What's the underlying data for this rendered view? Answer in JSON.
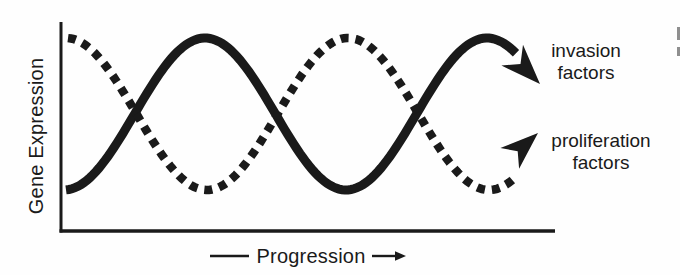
{
  "figure": {
    "background_color": "#fefefe",
    "ink_color": "#1a1a1a",
    "y_axis_label": "Gene Expression",
    "x_axis_label": "Progression",
    "invasion_label_line1": "invasion",
    "invasion_label_line2": "factors",
    "proliferation_label_line1": "proliferation",
    "proliferation_label_line2": "factors"
  },
  "chart_data": {
    "type": "line",
    "title": "",
    "xlabel": "Progression",
    "ylabel": "Gene Expression",
    "x_axis_ticks": [],
    "y_axis_ticks": [],
    "grid": false,
    "legend_position": "right-annotations",
    "x_normalized": [
      0,
      0.1,
      0.2,
      0.3,
      0.4,
      0.5,
      0.6,
      0.7,
      0.8,
      0.9,
      1.0
    ],
    "series": [
      {
        "name": "invasion factors",
        "line_style": "solid",
        "ends_with": "arrowhead pointing down-right",
        "values": [
          0.0,
          0.25,
          0.73,
          1.0,
          0.8,
          0.32,
          0.01,
          0.16,
          0.62,
          0.97,
          0.88
        ]
      },
      {
        "name": "proliferation factors",
        "line_style": "dotted",
        "ends_with": "arrowhead pointing up-right",
        "values": [
          1.0,
          0.75,
          0.27,
          0.0,
          0.2,
          0.68,
          0.99,
          0.84,
          0.38,
          0.03,
          0.12
        ]
      }
    ],
    "annotations": [
      "schematic: two antiphase sinusoidal curves, no numeric scale",
      "solid curve = invasion factors; dotted curve = proliferation factors",
      "x-axis label flanked by a dash and a right-pointing arrow"
    ],
    "render": {
      "midline_y": 114,
      "amplitude": 76,
      "period": 282,
      "solid_peak_x": 205,
      "dashed_peak_x": 348,
      "solid_x": [
        66,
        516
      ],
      "dashed_x": [
        68,
        516
      ],
      "solid_stroke_width": 9,
      "dashed_stroke_width": 8.5,
      "dash_array": "8 7",
      "solid_arrow": {
        "tip_x": 540,
        "tip_y": 84,
        "angle_deg": 46,
        "length": 40,
        "half_width": 15,
        "notch": 0.7
      },
      "dashed_arrow": {
        "tip_x": 538,
        "tip_y": 133,
        "angle_deg": -42,
        "length": 38,
        "half_width": 14,
        "notch": 0.72
      }
    }
  },
  "page": {
    "edge_artifacts": [
      {
        "x": 677,
        "y": 27,
        "w": 3,
        "h": 13
      },
      {
        "x": 677,
        "y": 47,
        "w": 3,
        "h": 9
      }
    ]
  }
}
